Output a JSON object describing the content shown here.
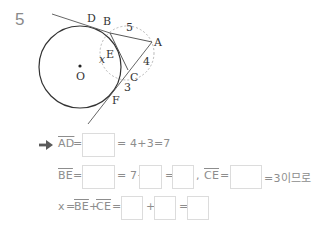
{
  "problem": {
    "number": "5"
  },
  "diagram": {
    "labels": {
      "D": "D",
      "B": "B",
      "A": "A",
      "E": "E",
      "x": "x",
      "O": "O",
      "C": "C",
      "F": "F",
      "len_BA": "5",
      "len_AC": "4",
      "len_CF": "3"
    }
  },
  "solution": {
    "arrow_icon": "right-arrow",
    "row1": {
      "lhs": "AD",
      "eq1": "=",
      "rest": "= 4+3=7"
    },
    "row2": {
      "lhs": "BE",
      "eq1": "=",
      "mid": "= 7−",
      "eq2": "=",
      "comma": ",",
      "lhs2": "CE",
      "eq3": "=",
      "tail": "=3이므로"
    },
    "row3": {
      "lhs_x": "x",
      "eq0": "=",
      "seg1": "BE",
      "plus0": "+",
      "seg2": "CE",
      "eq1": "=",
      "plus": "+",
      "eq2": "="
    }
  },
  "colors": {
    "text": "#8d8d8d",
    "box_border": "#dcdcdc",
    "diagram_line": "#333333",
    "dashed": "#b5b5b5"
  }
}
